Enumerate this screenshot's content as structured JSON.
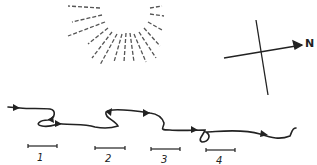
{
  "figure": {
    "compass": {
      "label": "N"
    },
    "scale_bars": [
      {
        "label": "1"
      },
      {
        "label": "2"
      },
      {
        "label": "3"
      },
      {
        "label": "4"
      }
    ],
    "colors": {
      "ink": "#222222",
      "rays": "#555555",
      "background": "#ffffff"
    }
  }
}
